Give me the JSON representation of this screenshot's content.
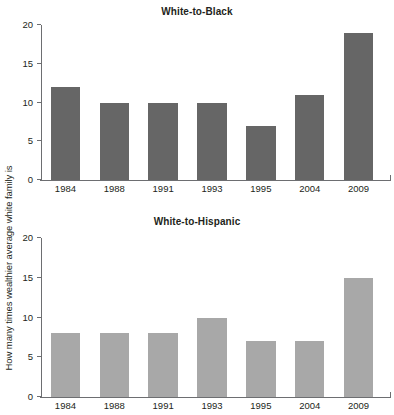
{
  "figure": {
    "y_axis_caption": "How many times wealthier average white family is"
  },
  "chart_data": [
    {
      "type": "bar",
      "title": "White-to-Black",
      "categories": [
        "1984",
        "1988",
        "1991",
        "1993",
        "1995",
        "2004",
        "2009"
      ],
      "values": [
        12,
        10,
        10,
        10,
        7,
        11,
        19
      ],
      "xlabel": "",
      "ylabel": "How many times wealthier average white family is",
      "ylim": [
        0,
        20
      ],
      "yticks": [
        0,
        5,
        10,
        15,
        20
      ],
      "ytick_labels": [
        "0",
        "5",
        "10",
        "15",
        "20"
      ],
      "grid": false,
      "legend": "none",
      "bar_color": "#666666"
    },
    {
      "type": "bar",
      "title": "White-to-Hispanic",
      "categories": [
        "1984",
        "1988",
        "1991",
        "1993",
        "1995",
        "2004",
        "2009"
      ],
      "values": [
        8,
        8,
        8,
        10,
        7,
        7,
        15
      ],
      "xlabel": "",
      "ylabel": "How many times wealthier average white family is",
      "ylim": [
        0,
        20
      ],
      "yticks": [
        0,
        5,
        10,
        15,
        20
      ],
      "ytick_labels": [
        "0",
        "5",
        "10",
        "15",
        "20"
      ],
      "grid": false,
      "legend": "none",
      "bar_color": "#a8a8a8"
    }
  ]
}
